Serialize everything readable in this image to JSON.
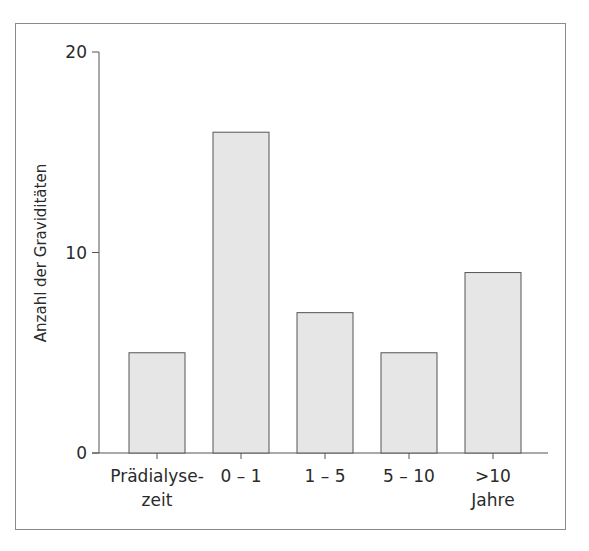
{
  "chart_data": {
    "type": "bar",
    "title": "",
    "xlabel": "",
    "ylabel": "Anzahl der Graviditäten",
    "categories": [
      "Prädialysezeit",
      "0 – 1",
      "1 – 5",
      "5 – 10",
      ">10 Jahre"
    ],
    "category_label_lines": [
      [
        "Prädialyse-",
        "zeit"
      ],
      [
        "0 – 1"
      ],
      [
        "1 – 5"
      ],
      [
        "5 – 10"
      ],
      [
        ">10",
        "Jahre"
      ]
    ],
    "values": [
      5,
      16,
      7,
      5,
      9
    ],
    "ylim": [
      0,
      20
    ],
    "yticks": [
      0,
      10,
      20
    ],
    "grid": false,
    "legend": null,
    "bar_color": "#e6e6e6",
    "bar_edge_color": "#555555"
  }
}
